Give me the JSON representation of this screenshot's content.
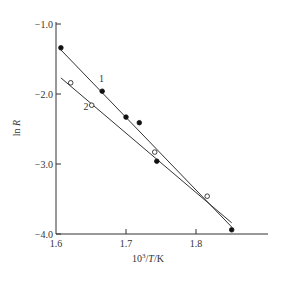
{
  "chart_data": {
    "type": "scatter",
    "title": "",
    "xlabel": "10^3/T/K",
    "ylabel": "ln R",
    "xlim": [
      1.6,
      1.9
    ],
    "ylim": [
      -4.0,
      -1.0
    ],
    "grid": false,
    "x_ticks": [
      "1.6",
      "1.7",
      "1.8"
    ],
    "y_ticks": [
      "-1.0",
      "-2.0",
      "-3.0",
      "-4.0"
    ],
    "series": [
      {
        "name": "1",
        "marker": "filled-circle",
        "x": [
          1.607,
          1.666,
          1.7,
          1.719,
          1.744,
          1.851
        ],
        "y": [
          -1.34,
          -1.96,
          -2.33,
          -2.41,
          -2.96,
          -3.94
        ],
        "fit_line": {
          "x": [
            1.607,
            1.851
          ],
          "y": [
            -1.37,
            -3.9
          ]
        }
      },
      {
        "name": "2",
        "marker": "open-circle",
        "x": [
          1.621,
          1.651,
          1.741,
          1.816
        ],
        "y": [
          -1.84,
          -2.16,
          -2.83,
          -3.46
        ],
        "fit_line": {
          "x": [
            1.607,
            1.851
          ],
          "y": [
            -1.77,
            -3.84
          ]
        }
      }
    ],
    "annotations": [
      {
        "text": "1",
        "x": 1.665,
        "y": -1.83
      },
      {
        "text": "2",
        "x": 1.643,
        "y": -2.23
      }
    ]
  }
}
